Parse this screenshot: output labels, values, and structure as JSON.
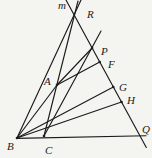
{
  "figure": {
    "width": 152,
    "height": 158,
    "background_color": "#f4f4f1",
    "stroke_color": "#1b1b1b",
    "stroke_width": 1.15,
    "label_color": "#1b1b1b",
    "label_font_size": 11,
    "line_label": "m",
    "line_label_x": 58,
    "line_label_y": 9,
    "points": [
      {
        "label": "R",
        "x": 74.3,
        "y": 14.6,
        "dot": false,
        "label_x": 87,
        "label_y": 18
      },
      {
        "label": "P",
        "x": 92.1,
        "y": 48,
        "dot": true,
        "label_x": 101,
        "label_y": 55
      },
      {
        "label": "F",
        "x": 99.7,
        "y": 62,
        "dot": true,
        "label_x": 108,
        "label_y": 68
      },
      {
        "label": "A",
        "x": 57,
        "y": 85,
        "dot": true,
        "label_x": 44,
        "label_y": 85
      },
      {
        "label": "G",
        "x": 113.3,
        "y": 87,
        "dot": true,
        "label_x": 119,
        "label_y": 91
      },
      {
        "label": "H",
        "x": 121.5,
        "y": 102,
        "dot": true,
        "label_x": 127,
        "label_y": 104
      },
      {
        "label": "Q",
        "x": 139.8,
        "y": 135.9,
        "dot": false,
        "label_x": 142,
        "label_y": 133
      },
      {
        "label": "B",
        "x": 17,
        "y": 138,
        "dot": true,
        "label_x": 7,
        "label_y": 150
      },
      {
        "label": "C",
        "x": 44,
        "y": 136,
        "dot": true,
        "label_x": 45,
        "label_y": 154
      }
    ],
    "segments": [
      {
        "name": "base-line-B-C-Q",
        "x1": 16.5,
        "y1": 138.4,
        "x2": 146,
        "y2": 135.8
      },
      {
        "name": "transversal-line-m",
        "x1": 66,
        "y1": 0,
        "x2": 146.3,
        "y2": 147.5
      },
      {
        "name": "line-B-R",
        "x1": 17,
        "y1": 138,
        "x2": 81,
        "y2": 0
      },
      {
        "name": "line-C-A-R",
        "x1": 44,
        "y1": 136,
        "x2": 78,
        "y2": 1
      },
      {
        "name": "segment-B-A",
        "x1": 17,
        "y1": 138,
        "x2": 57,
        "y2": 85
      },
      {
        "name": "segment-A-P",
        "x1": 57,
        "y1": 85,
        "x2": 92.1,
        "y2": 48
      },
      {
        "name": "segment-A-F",
        "x1": 57,
        "y1": 85,
        "x2": 99.7,
        "y2": 62
      },
      {
        "name": "line-C-P-extended",
        "x1": 44,
        "y1": 136,
        "x2": 101,
        "y2": 31
      },
      {
        "name": "segment-B-G",
        "x1": 17,
        "y1": 138,
        "x2": 113.3,
        "y2": 87
      },
      {
        "name": "segment-B-H",
        "x1": 17,
        "y1": 138,
        "x2": 121.5,
        "y2": 102
      }
    ]
  }
}
